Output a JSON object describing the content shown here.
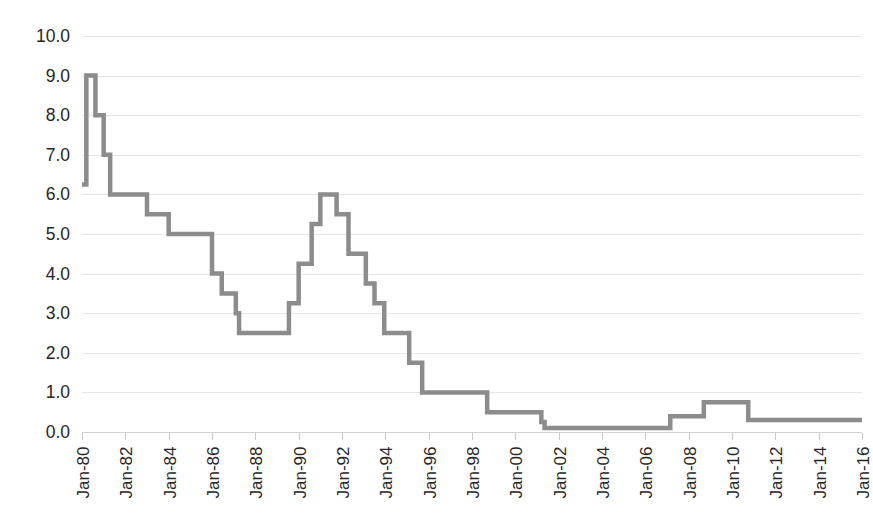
{
  "chart_data": {
    "type": "line",
    "title": "",
    "subtitle": "",
    "xlabel": "",
    "ylabel": "",
    "grid": true,
    "legend": false,
    "legend_position": "none",
    "line_color": "#8C8C8C",
    "line_width": 4.5,
    "gridline_color": "#E6E6E6",
    "axis_color": "#D0D0D0",
    "text_color": "#262626",
    "background_color": "#FFFFFF",
    "xlim": [
      "Jan-80",
      "Jan-16"
    ],
    "ylim": [
      0.0,
      10.0
    ],
    "y_tick_step": 1.0,
    "y_tick_labels": [
      "0.0",
      "1.0",
      "2.0",
      "3.0",
      "4.0",
      "5.0",
      "6.0",
      "7.0",
      "8.0",
      "9.0",
      "10.0"
    ],
    "y_tick_values": [
      0.0,
      1.0,
      2.0,
      3.0,
      4.0,
      5.0,
      6.0,
      7.0,
      8.0,
      9.0,
      10.0
    ],
    "x_tick_labels": [
      "Jan-80",
      "Jan-82",
      "Jan-84",
      "Jan-86",
      "Jan-88",
      "Jan-90",
      "Jan-92",
      "Jan-94",
      "Jan-96",
      "Jan-98",
      "Jan-00",
      "Jan-02",
      "Jan-04",
      "Jan-06",
      "Jan-08",
      "Jan-10",
      "Jan-12",
      "Jan-14",
      "Jan-16"
    ],
    "x_tick_label_rotation": -90,
    "x_tick_values": [
      1980,
      1982,
      1984,
      1986,
      1988,
      1990,
      1992,
      1994,
      1996,
      1998,
      2000,
      2002,
      2004,
      2006,
      2008,
      2010,
      2012,
      2014,
      2016
    ],
    "series": [
      {
        "name": "Policy rate",
        "color": "#8C8C8C",
        "step_style": "stepwise",
        "x": [
          1980.0,
          1980.15,
          1980.2,
          1980.55,
          1980.62,
          1980.9,
          1981.0,
          1981.2,
          1981.3,
          1982.0,
          1983.0,
          1983.9,
          1984.0,
          1985.6,
          1986.0,
          1986.2,
          1986.45,
          1986.75,
          1987.1,
          1987.25,
          1989.3,
          1989.55,
          1989.8,
          1990.0,
          1990.25,
          1990.6,
          1991.0,
          1991.55,
          1991.75,
          1992.0,
          1992.3,
          1992.6,
          1993.1,
          1993.5,
          1993.95,
          1995.1,
          1995.45,
          1995.7,
          1998.7,
          2001.02,
          2001.2,
          2001.35,
          2006.55,
          2007.15,
          2008.7,
          2008.95,
          2010.75,
          2016.0
        ],
        "y": [
          6.25,
          6.25,
          9.0,
          9.0,
          8.0,
          8.0,
          7.0,
          7.0,
          6.0,
          6.0,
          5.5,
          5.5,
          5.0,
          5.0,
          4.0,
          4.0,
          3.5,
          3.5,
          3.0,
          2.5,
          2.5,
          3.25,
          3.25,
          4.25,
          4.25,
          5.25,
          6.0,
          6.0,
          5.5,
          5.5,
          4.5,
          4.5,
          3.75,
          3.25,
          2.5,
          1.75,
          1.75,
          1.0,
          0.5,
          0.5,
          0.25,
          0.1,
          0.1,
          0.4,
          0.75,
          0.75,
          0.3,
          0.3
        ],
        "note": "stepwise policy rate path, percent"
      }
    ]
  },
  "axes": {
    "y_axis_name": "rate-percent",
    "x_axis_name": "date"
  }
}
